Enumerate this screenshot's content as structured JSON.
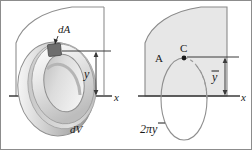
{
  "figure": {
    "frame": {
      "width": 252,
      "height": 150,
      "border_color": "#8c8c8c",
      "background": "#ffffff"
    },
    "colors": {
      "area_fill": "#e7e7e7",
      "area_stroke": "#8a8a8a",
      "axis_stroke": "#3b3b3b",
      "torus_light": "#f2f2f2",
      "torus_mid": "#cfcfcf",
      "torus_dark": "#9a9a9a",
      "patch_fill": "#6e6e6e",
      "dashed_stroke": "#9a9a9a",
      "text": "#1a1a1a"
    },
    "left_panel": {
      "name": "differential-element-panel",
      "labels": {
        "dA": "dA",
        "y": "y",
        "x": "x",
        "dV": "dV"
      }
    },
    "right_panel": {
      "name": "centroid-panel",
      "labels": {
        "A": "A",
        "C": "C",
        "ybar": "y",
        "ybar_overbar": true,
        "x": "x",
        "circumference": "2πy",
        "circumference_parts": {
          "coef": "2",
          "pi": "π",
          "var": "y"
        }
      }
    }
  }
}
